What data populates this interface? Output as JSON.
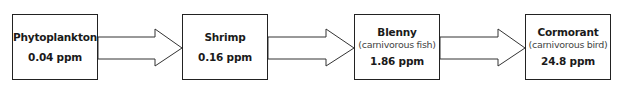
{
  "diagram": {
    "type": "food-chain-flow",
    "nodes": [
      {
        "name": "Phytoplankton",
        "description": null,
        "value": "0.04 ppm"
      },
      {
        "name": "Shrimp",
        "description": null,
        "value": "0.16 ppm"
      },
      {
        "name": "Blenny",
        "description": "(carnivorous fish)",
        "value": "1.86 ppm"
      },
      {
        "name": "Cormorant",
        "description": "(carnivorous bird)",
        "value": "24.8 ppm"
      }
    ],
    "edges": [
      {
        "from": "Phytoplankton",
        "to": "Shrimp"
      },
      {
        "from": "Shrimp",
        "to": "Blenny"
      },
      {
        "from": "Blenny",
        "to": "Cormorant"
      }
    ],
    "colors": {
      "stroke": "#222222",
      "fill": "#ffffff",
      "text": "#1a1a1a",
      "desc_text": "#444444"
    }
  }
}
